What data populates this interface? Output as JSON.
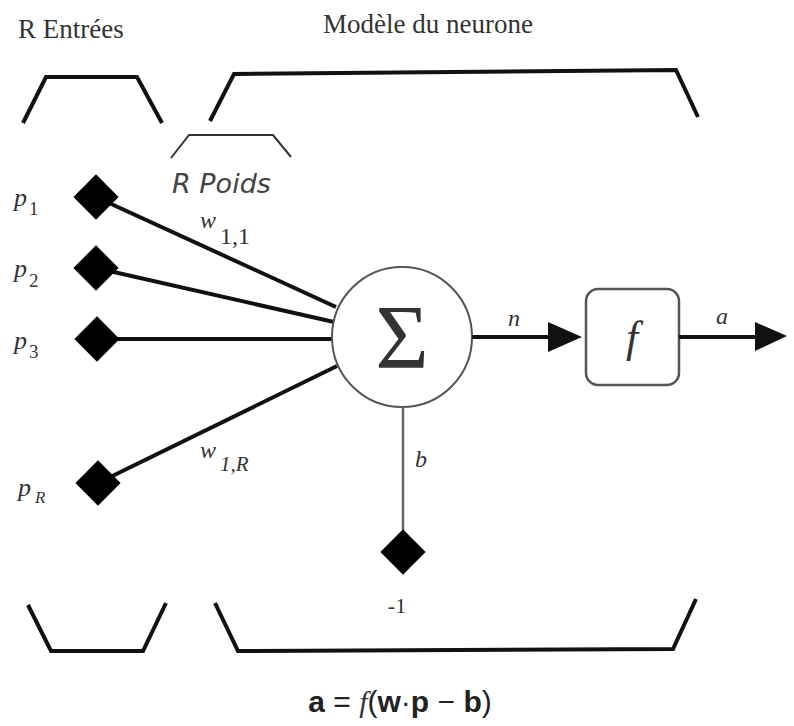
{
  "title_inputs": "R Entrées",
  "title_model": "Modèle du  neurone",
  "weights_label": "R Poids",
  "inputs": [
    {
      "base": "p",
      "sub": "1"
    },
    {
      "base": "p",
      "sub": "2"
    },
    {
      "base": "p",
      "sub": "3"
    },
    {
      "base": "p",
      "sub": "R"
    }
  ],
  "weights": [
    {
      "base": "w",
      "sub": "1,1"
    },
    {
      "base": "w",
      "sub": "1,R"
    }
  ],
  "summation_symbol": "Σ",
  "net_label": "n",
  "transfer_label": "f",
  "output_label": "a",
  "bias_label": "b",
  "bias_input_value": "-1",
  "formula": {
    "lhs": "a",
    "eq": " = ",
    "func": "f",
    "open": "(",
    "w": "w",
    "dot": "·",
    "p": "p",
    "minus": " − ",
    "b": "b",
    "close": ")"
  },
  "colors": {
    "line": "#111111",
    "text": "#333333",
    "background": "#ffffff"
  }
}
